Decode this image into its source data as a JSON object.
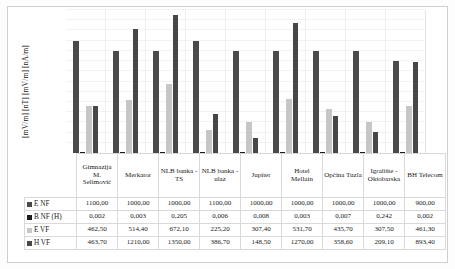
{
  "chart_data": {
    "type": "bar",
    "title": "",
    "subtitle": "",
    "xlabel": "",
    "ylabel": "[mV/m] [nT] [mV/m] [nA/m]",
    "ylim": [
      0,
      1400
    ],
    "grid": true,
    "grid_step": 100,
    "legend_position": "table-left",
    "axis_ticks_visible": false,
    "categories": [
      "Gimnazija M. Selimović",
      "Merkator",
      "NLB banka - TS",
      "NLB banka - ulaz",
      "Jupiter",
      "Hotel Mellain",
      "Općina Tuzla",
      "Igralište - Oktobarska",
      "BH Telecom"
    ],
    "series": [
      {
        "name": "E NF",
        "color": "#4a4a4a",
        "values": [
          1100.0,
          1000.0,
          1000.0,
          1100.0,
          1000.0,
          1000.0,
          1000.0,
          1000.0,
          900.0
        ],
        "labels": [
          "1100,00",
          "1000,00",
          "1000,00",
          "1100,00",
          "1000,00",
          "1000,00",
          "1000,00",
          "1000,00",
          "900,00"
        ]
      },
      {
        "name": "B NF (H)",
        "color": "#1c1c1c",
        "values": [
          0.002,
          0.003,
          0.205,
          0.006,
          0.008,
          0.003,
          0.007,
          0.242,
          0.002
        ],
        "labels": [
          "0,002",
          "0,003",
          "0,205",
          "0,006",
          "0,008",
          "0,003",
          "0,007",
          "0,242",
          "0,002"
        ]
      },
      {
        "name": "E VF",
        "color": "#c6c6c6",
        "values": [
          462.5,
          514.4,
          672.1,
          225.2,
          307.4,
          531.7,
          435.7,
          307.5,
          461.3
        ],
        "labels": [
          "462,50",
          "514,40",
          "672,10",
          "225,20",
          "307,40",
          "531,70",
          "435,70",
          "307,50",
          "461,30"
        ]
      },
      {
        "name": "H VF",
        "color": "#474747",
        "values": [
          463.7,
          1210.0,
          1350.0,
          386.7,
          148.5,
          1270.0,
          358.6,
          209.1,
          893.4
        ],
        "labels": [
          "463,70",
          "1210,00",
          "1350,00",
          "386,70",
          "148,50",
          "1270,00",
          "358,60",
          "209,10",
          "893,40"
        ]
      }
    ]
  }
}
